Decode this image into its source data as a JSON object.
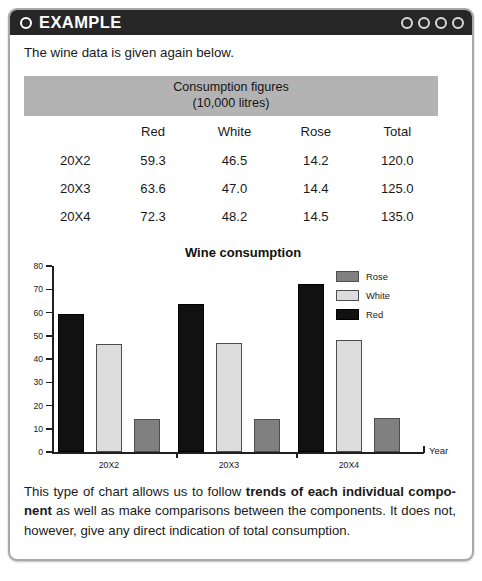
{
  "header": {
    "bullet_icon": "circle-outline-icon",
    "title": "EXAMPLE",
    "dots": [
      "circle-icon",
      "circle-icon",
      "circle-icon",
      "circle-icon"
    ]
  },
  "intro": {
    "text": "The wine data is given again below."
  },
  "table": {
    "caption_line1": "Consumption figures",
    "caption_line2": "(10,000 litres)",
    "columns": [
      "",
      "Red",
      "White",
      "Rose",
      "Total"
    ],
    "rows": [
      {
        "label": "20X2",
        "values": [
          "59.3",
          "46.5",
          "14.2",
          "120.0"
        ]
      },
      {
        "label": "20X3",
        "values": [
          "63.6",
          "47.0",
          "14.4",
          "125.0"
        ]
      },
      {
        "label": "20X4",
        "values": [
          "72.3",
          "48.2",
          "14.5",
          "135.0"
        ]
      }
    ]
  },
  "chart_data": {
    "type": "bar",
    "title": "Wine consumption",
    "xlabel": "Year",
    "ylabel": "",
    "categories": [
      "20X2",
      "20X3",
      "20X4"
    ],
    "series": [
      {
        "name": "Red",
        "values": [
          59.3,
          63.6,
          72.3
        ],
        "color": "#111111"
      },
      {
        "name": "White",
        "values": [
          46.5,
          47.0,
          48.2
        ],
        "color": "#dcdcdc"
      },
      {
        "name": "Rose",
        "values": [
          14.2,
          14.4,
          14.5
        ],
        "color": "#808080"
      }
    ],
    "legend_order": [
      "Rose",
      "White",
      "Red"
    ],
    "legend_position": "top-right",
    "ylim": [
      0,
      80
    ],
    "yticks": [
      0,
      10,
      20,
      30,
      40,
      50,
      60,
      70,
      80
    ],
    "ytick_labels": [
      "0",
      "10",
      "20",
      "30",
      "40",
      "50",
      "60",
      "70",
      "80"
    ],
    "grid": false
  },
  "footer": {
    "part1": "This type of chart allows us to follow ",
    "bold1": "trends of each individual compo-nent",
    "part2": " as well as make comparisons between the components.  It does not, however, give any direct indication of total consumption."
  },
  "colors": {
    "header_bg": "#262626",
    "table_caption_bg": "#b3b3b3",
    "red_series": "#111111",
    "white_series": "#dcdcdc",
    "rose_series": "#808080",
    "box_border": "#a8a8a8"
  }
}
